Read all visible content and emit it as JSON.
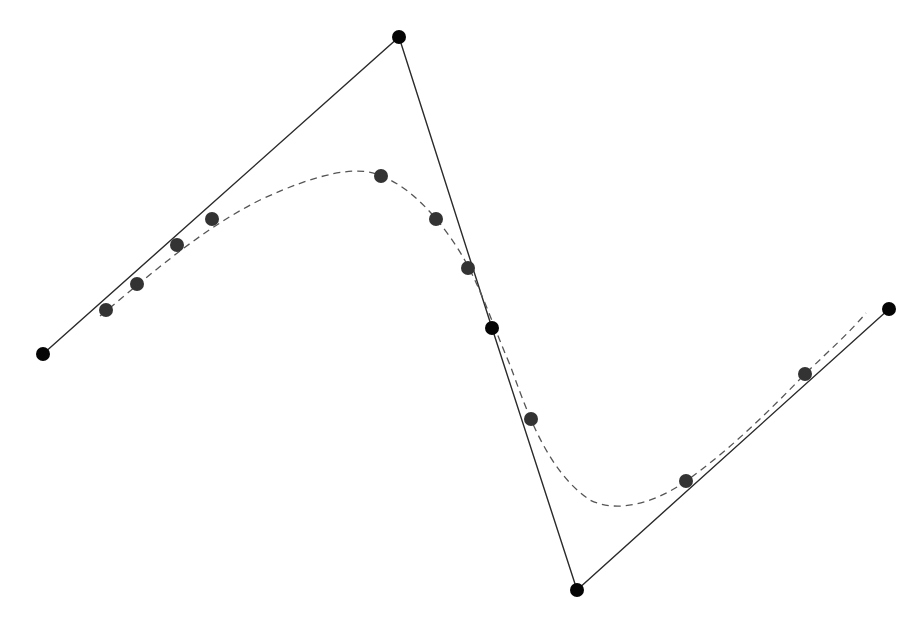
{
  "diagram": {
    "colors": {
      "background": "#ffffff",
      "control_line": "#2a2a2a",
      "curve": "#555555",
      "control_point": "#050505",
      "sample_point": "#333333"
    },
    "control_points": [
      {
        "x": 43,
        "y": 354
      },
      {
        "x": 399,
        "y": 37
      },
      {
        "x": 492,
        "y": 328
      },
      {
        "x": 577,
        "y": 590
      },
      {
        "x": 889,
        "y": 309
      }
    ],
    "curve_path": "M 100 316 C 150 275, 200 230, 260 200 C 320 172, 360 165, 381 176 C 420 190, 455 240, 470 270 C 485 300, 495 330, 510 365 C 525 405, 545 470, 590 500 C 620 515, 660 500, 686 481 C 730 450, 770 410, 805 374 C 830 350, 850 332, 866 313",
    "sample_points": [
      {
        "x": 106,
        "y": 310
      },
      {
        "x": 137,
        "y": 284
      },
      {
        "x": 177,
        "y": 245
      },
      {
        "x": 212,
        "y": 219
      },
      {
        "x": 381,
        "y": 176
      },
      {
        "x": 436,
        "y": 219
      },
      {
        "x": 468,
        "y": 268
      },
      {
        "x": 531,
        "y": 419
      },
      {
        "x": 686,
        "y": 481
      },
      {
        "x": 805,
        "y": 374
      }
    ],
    "control_point_radius": 7,
    "sample_point_radius": 7
  }
}
